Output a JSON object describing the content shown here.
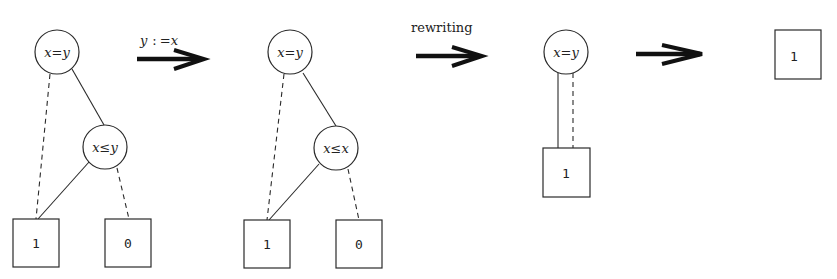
{
  "diagram": {
    "colors": {
      "stroke": "#2a2a2a",
      "background": "#ffffff",
      "arrow": "#111111"
    },
    "stages": [
      {
        "id": "bdd-original",
        "nodes": [
          {
            "id": "n1",
            "label": "x=y",
            "shape": "circle"
          },
          {
            "id": "n2",
            "label": "x≤y",
            "shape": "circle"
          },
          {
            "id": "t1",
            "label": "1",
            "shape": "box"
          },
          {
            "id": "t0",
            "label": "0",
            "shape": "box"
          }
        ],
        "edges": [
          {
            "from": "n1",
            "to": "t1",
            "style": "dashed"
          },
          {
            "from": "n1",
            "to": "n2",
            "style": "solid"
          },
          {
            "from": "n2",
            "to": "t1",
            "style": "solid"
          },
          {
            "from": "n2",
            "to": "t0",
            "style": "dashed"
          }
        ]
      },
      {
        "id": "bdd-substituted",
        "nodes": [
          {
            "id": "n1",
            "label": "x=y",
            "shape": "circle"
          },
          {
            "id": "n2",
            "label": "x≤x",
            "shape": "circle"
          },
          {
            "id": "t1",
            "label": "1",
            "shape": "box"
          },
          {
            "id": "t0",
            "label": "0",
            "shape": "box"
          }
        ],
        "edges": [
          {
            "from": "n1",
            "to": "t1",
            "style": "dashed"
          },
          {
            "from": "n1",
            "to": "n2",
            "style": "solid"
          },
          {
            "from": "n2",
            "to": "t1",
            "style": "solid"
          },
          {
            "from": "n2",
            "to": "t0",
            "style": "dashed"
          }
        ]
      },
      {
        "id": "bdd-rewritten",
        "nodes": [
          {
            "id": "n1",
            "label": "x=y",
            "shape": "circle"
          },
          {
            "id": "t1",
            "label": "1",
            "shape": "box"
          }
        ],
        "edges": [
          {
            "from": "n1",
            "to": "t1",
            "style": "solid"
          },
          {
            "from": "n1",
            "to": "t1",
            "style": "dashed"
          }
        ]
      },
      {
        "id": "bdd-reduced",
        "nodes": [
          {
            "id": "t1",
            "label": "1",
            "shape": "box"
          }
        ],
        "edges": []
      }
    ],
    "arrows": [
      {
        "label_lhs": "y",
        "label_op": ":",
        "label_rhs": "=x"
      },
      {
        "label": "rewriting"
      },
      {
        "label": ""
      }
    ]
  }
}
